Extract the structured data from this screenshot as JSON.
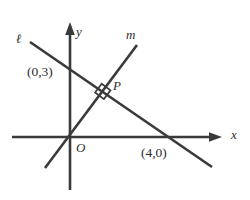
{
  "figure": {
    "type": "coordinate-geometry-diagram",
    "background_color": "#ffffff",
    "stroke_color": "#3a3a3a",
    "text_color": "#2e2e2e",
    "width": 250,
    "height": 200
  },
  "axes": {
    "x_axis_label": "x",
    "y_axis_label": "y",
    "origin_label": "O"
  },
  "lines": [
    {
      "name": "ℓ",
      "description": "line through (0,3) and (4,0), negative slope",
      "label": "ℓ"
    },
    {
      "name": "m",
      "description": "line through the origin, positive slope, perpendicular to line ℓ",
      "label": "m"
    }
  ],
  "points": [
    {
      "label": "(0,3)",
      "description": "y-intercept of line ℓ"
    },
    {
      "label": "(4,0)",
      "description": "x-intercept of line ℓ"
    },
    {
      "label": "P",
      "description": "intersection of line ℓ and line m"
    },
    {
      "label": "O",
      "description": "origin"
    }
  ],
  "marks": {
    "right_angle_at": "P",
    "right_angle_symbol": "square"
  },
  "geometry": {
    "y_axis": {
      "x": 70,
      "top": 22,
      "bottom": 190
    },
    "x_axis": {
      "y": 137,
      "left": 12,
      "right": 222
    },
    "line_l": {
      "x1": 30,
      "y1": 42,
      "x2": 212,
      "y2": 167
    },
    "line_m": {
      "x1": 45,
      "y1": 168,
      "x2": 137,
      "y2": 45
    },
    "intersection": {
      "x": 108,
      "y": 88
    }
  }
}
